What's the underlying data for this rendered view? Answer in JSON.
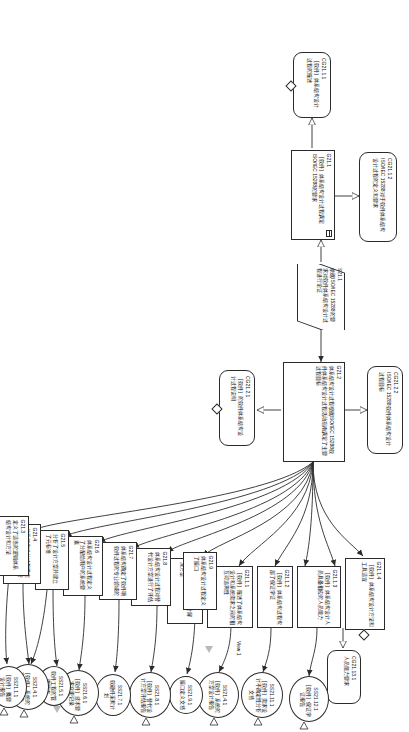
{
  "diagram": {
    "type": "gsn-assurance-case",
    "orientation": "rotated-90"
  },
  "nodes": {
    "cg21_1_2": {
      "id": "CG21.1.2",
      "text": "ISO/IEC 15288对于软件体系结构设计过程的定义和要求",
      "kind": "context"
    },
    "cg21_1_1": {
      "id": "CG21.1.1",
      "text": "［软件］体系结构设计过程的描述",
      "kind": "context"
    },
    "g21_1": {
      "id": "G21.1",
      "text": "［软件］体系结构设计过程满足ISO/IEC 15288的要求",
      "kind": "goal"
    },
    "s21_1": {
      "id": "S21.1",
      "text": "依据ISO/IEC 15288的要求对软件体系结构设计过程进行论证",
      "kind": "strategy"
    },
    "cg21_2_2": {
      "id": "CG21.2.2",
      "text": "ISO/IEC 15288软件体系结构设计过程目标",
      "kind": "context"
    },
    "cg21_2_1": {
      "id": "CG21.2.1",
      "text": "［软件］的软件体系结构设计过程说明",
      "kind": "context"
    },
    "g21_2": {
      "id": "G21.2",
      "text": "体系结构设计过程根据ISO/IEC 15288软件体系结构设计过程活动指南满足了主要过程目标",
      "kind": "goal"
    },
    "g21_1_4": {
      "id": "G21.1.4",
      "text": "［软件］体系结构设计方法和工具适宜",
      "kind": "goal"
    },
    "cg21_13_1": {
      "id": "CG21.13.1",
      "text": "人员能力要求",
      "kind": "context"
    },
    "g21_1_3": {
      "id": "G21.1.3",
      "text": "［软件］体系结构设计人员具备相应的人员能力",
      "kind": "goal"
    },
    "g21_1_2": {
      "id": "G21.1.2",
      "text": "［软件］体系结构过程构部了保证学证",
      "kind": "goal"
    },
    "g21_1_1": {
      "id": "G21.1.1",
      "text": "［软件］描述了体系结构设计和系统需求之间的相互可追溯性",
      "kind": "goal"
    },
    "g21_10": {
      "id": "G21.10",
      "text": "指定了选择的物理设计解决方案",
      "kind": "goal"
    },
    "g21_9": {
      "id": "G21.9",
      "text": "体系结构设计过程定义了接口",
      "kind": "goal"
    },
    "g21_8": {
      "id": "G21.8",
      "text": "体系结构设计过程对替代设计方案进行了评估",
      "kind": "goal"
    },
    "g21_7": {
      "id": "G21.7",
      "text": "体系结构确定了软件项软件过程的专业领域的",
      "kind": "goal"
    },
    "g21_6": {
      "id": "G21.6",
      "text": "体系结构设计过程定义了分配给用户的系统要素",
      "kind": "goal"
    },
    "g21_5": {
      "id": "G21.5",
      "text": "分析了设计方案并建立了元标准",
      "kind": "goal"
    },
    "g21_4": {
      "id": "G21.4",
      "text": "体系结构设计过程确定了系统的功能划分和分配",
      "kind": "goal"
    },
    "g21_3": {
      "id": "G21.3",
      "text": "定义了适当的逻辑体系结构设计和方法",
      "kind": "goal"
    },
    "ss21_12_1": {
      "id": "SS21.12.1",
      "text": "［软件］保证学证报告",
      "kind": "solution"
    },
    "ss21_11_1": {
      "id": "SS21.11.1",
      "text": "［软件］需求设计不确定性分析文档",
      "kind": "solution"
    },
    "ss21_4_1_top": {
      "id": "SS21.4.1",
      "text": "［软件］系统的方案设计报告",
      "kind": "solution"
    },
    "ss21_9_1": {
      "id": "SS21.9.1",
      "text": "接口定义文档",
      "kind": "solution"
    },
    "ss21_8_1": {
      "id": "SS21.8.1",
      "text": "［软件］替代设计方案评估报告",
      "kind": "solution"
    },
    "ss21_7_1": {
      "id": "SS21.7.1",
      "text": "软硬件采购计划",
      "kind": "solution"
    },
    "ss21_6_1": {
      "id": "SS21.6.1",
      "text": "［软件］技术要求变更记录",
      "kind": "solution"
    },
    "ss21_5_1": {
      "id": "SS21.5.1",
      "text": "软件工程的管理要求",
      "kind": "solution"
    },
    "ss21_4_1_bot": {
      "id": "SS21.4.1",
      "text": "［软件］系统的方案设计报告",
      "kind": "solution"
    },
    "ss21_1_1": {
      "id": "SS21.1.1",
      "text": "［软件］概要设计报告",
      "kind": "solution"
    }
  },
  "annotations": {
    "view1": "View 1"
  },
  "colors": {
    "stroke": "#2b2b2b",
    "fill": "#ffffff",
    "grey_marker": "#b9b9b9"
  }
}
